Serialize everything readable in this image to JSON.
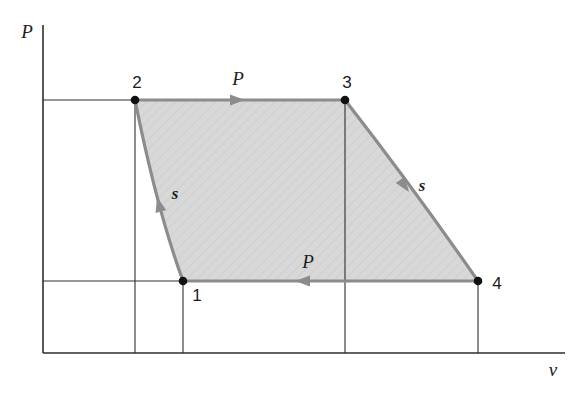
{
  "axes": {
    "y_label": "P",
    "x_label": "v"
  },
  "states": [
    {
      "label": "1"
    },
    {
      "label": "2"
    },
    {
      "label": "3"
    },
    {
      "label": "4"
    }
  ],
  "processes": [
    {
      "from": "2",
      "to": "3",
      "type_label": "P",
      "kind": "constant-pressure",
      "arrow_direction": "right"
    },
    {
      "from": "3",
      "to": "4",
      "type_label": "s",
      "kind": "isentropic",
      "arrow_direction": "down-right"
    },
    {
      "from": "4",
      "to": "1",
      "type_label": "P",
      "kind": "constant-pressure",
      "arrow_direction": "left"
    },
    {
      "from": "1",
      "to": "2",
      "type_label": "s",
      "kind": "isentropic",
      "arrow_direction": "up-left"
    }
  ],
  "colors": {
    "background": "#ffffff",
    "shade_fill": "#d8d8d8",
    "process_line": "#8c8c8c",
    "thin_line": "#2e2e2e",
    "state_dot": "#111111",
    "label_text": "#1c1c1c"
  }
}
